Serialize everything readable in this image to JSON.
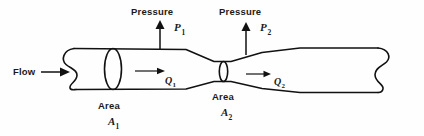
{
  "figure": {
    "type": "venturi-pipe-flow-diagram",
    "background_color": "#fefefe",
    "line_color": "#111111",
    "width": 424,
    "height": 136
  },
  "labels": {
    "flow": "Flow",
    "pressure_1": "Pressure",
    "pressure_2": "Pressure",
    "area_1": "Area",
    "area_2": "Area"
  },
  "symbols": {
    "p1_base": "P",
    "p1_sub": "1",
    "p2_base": "P",
    "p2_sub": "2",
    "a1_base": "A",
    "a1_sub": "1",
    "a2_base": "A",
    "a2_sub": "2",
    "q1_base": "Q",
    "q1_sub": "1",
    "q2_base": "Q",
    "q2_sub": "2"
  },
  "icons": {
    "flow_arrow": "arrow-right-icon",
    "pressure_arrow_1": "arrow-up-icon",
    "pressure_arrow_2": "arrow-up-icon",
    "flowrate_arrow_1": "arrow-right-icon",
    "flowrate_arrow_2": "arrow-right-icon",
    "pipe_left_end": "pipe-cut-end-icon",
    "pipe_right_end": "pipe-cut-end-icon",
    "cross_section_1": "ellipse-cross-section-icon",
    "cross_section_2": "ellipse-cross-section-icon"
  }
}
